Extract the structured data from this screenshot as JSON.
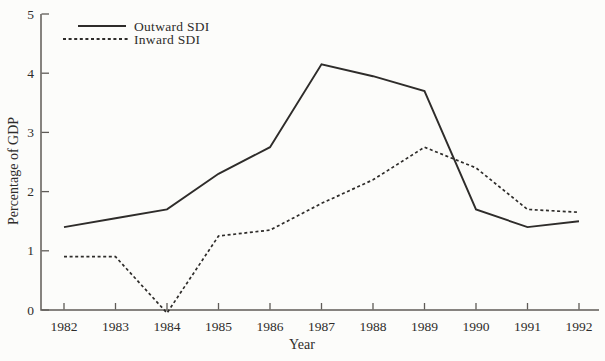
{
  "figure": {
    "background": "#fcfcfa",
    "ink_color": "#2e2c2a",
    "axis_color": "#5f5b57"
  },
  "chart_data": {
    "type": "line",
    "title": "",
    "xlabel": "Year",
    "ylabel": "Percentage of GDP",
    "x": [
      1982,
      1983,
      1984,
      1985,
      1986,
      1987,
      1988,
      1989,
      1990,
      1991,
      1992
    ],
    "x_tick_labels": [
      "1982",
      "1983",
      "1984",
      "1985",
      "1986",
      "1987",
      "1988",
      "1989",
      "1990",
      "1991",
      "1992"
    ],
    "y_ticks": [
      0,
      1,
      2,
      3,
      4,
      5
    ],
    "ylim": [
      0,
      5
    ],
    "xlim": [
      1982,
      1992
    ],
    "grid": false,
    "legend_position": "upper-left-inside",
    "series": [
      {
        "name": "Outward SDI",
        "line_style": "solid",
        "values": [
          1.4,
          1.55,
          1.7,
          2.3,
          2.75,
          4.15,
          3.95,
          3.7,
          1.7,
          1.4,
          1.5
        ]
      },
      {
        "name": "Inward SDI",
        "line_style": "dashed",
        "values": [
          0.9,
          0.9,
          -0.05,
          1.25,
          1.35,
          1.8,
          2.2,
          2.75,
          2.4,
          1.7,
          1.65
        ]
      }
    ]
  }
}
